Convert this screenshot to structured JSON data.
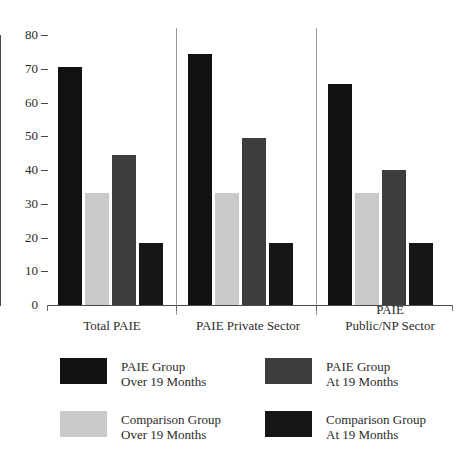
{
  "chart_data": {
    "type": "bar",
    "title": "",
    "subtitle": "",
    "xlabel": "",
    "ylabel": "",
    "ylim": [
      0,
      80
    ],
    "yticks": [
      0,
      10,
      20,
      30,
      40,
      50,
      60,
      70,
      80
    ],
    "grid": false,
    "legend_position": "bottom",
    "categories": [
      "Total PAIE",
      "PAIE Private Sector",
      "PAIE\nPublic/NP Sector"
    ],
    "series": [
      {
        "name": "PAIE Group Over 19 Months",
        "label_line1": "PAIE Group",
        "label_line2": "Over 19 Months",
        "color": "#111111",
        "values": [
          70.5,
          74.5,
          65.5
        ]
      },
      {
        "name": "Comparison Group Over 19 Months",
        "label_line1": "Comparison Group",
        "label_line2": "Over 19 Months",
        "color": "#c9c9c9",
        "values": [
          33.3,
          33.3,
          33.3
        ]
      },
      {
        "name": "PAIE Group At 19 Months",
        "label_line1": "PAIE Group",
        "label_line2": "At 19 Months",
        "color": "#3d3d3d",
        "values": [
          44.5,
          49.5,
          40.0
        ]
      },
      {
        "name": "Comparison Group At 19 Months",
        "label_line1": "Comparison Group",
        "label_line2": "At 19 Months",
        "color": "#161616",
        "values": [
          18.3,
          18.3,
          18.3
        ]
      }
    ]
  },
  "axis": {
    "y_tick_labels": [
      "80",
      "70",
      "60",
      "50",
      "40",
      "30",
      "20",
      "10",
      "0"
    ]
  },
  "legend": {
    "items": [
      {
        "line1": "PAIE Group",
        "line2": "Over 19 Months",
        "color": "#111111"
      },
      {
        "line1": "PAIE Group",
        "line2": "At 19 Months",
        "color": "#3d3d3d"
      },
      {
        "line1": "Comparison Group",
        "line2": "Over 19 Months",
        "color": "#c9c9c9"
      },
      {
        "line1": "Comparison Group",
        "line2": "At 19 Months",
        "color": "#161616"
      }
    ]
  }
}
